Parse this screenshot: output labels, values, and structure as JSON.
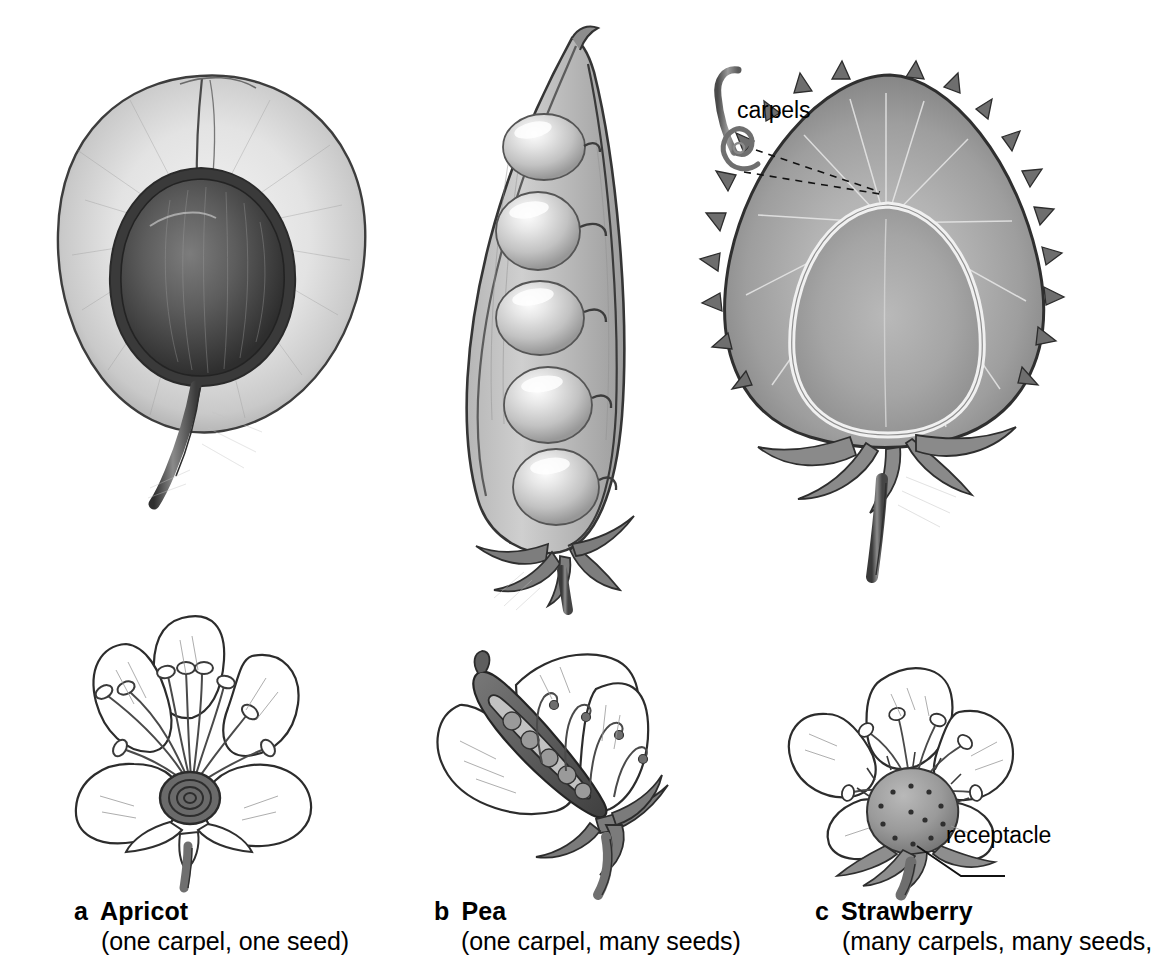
{
  "figure": {
    "background_color": "#ffffff",
    "ink_color": "#000000"
  },
  "callouts": {
    "carpels": "carpels",
    "receptacle": "receptacle"
  },
  "captions": [
    {
      "letter": "a",
      "title": "Apricot",
      "subtitle": "(one carpel, one seed)"
    },
    {
      "letter": "b",
      "title": "Pea",
      "subtitle": "(one carpel, many seeds)"
    },
    {
      "letter": "c",
      "title": "Strawberry",
      "subtitle": "(many carpels, many seeds,"
    }
  ],
  "panels": {
    "apricot_fruit": "apricot-longitudinal-section",
    "pea_fruit": "pea-pod-open-five-seeds",
    "strawberry_fruit": "strawberry-longitudinal-section",
    "apricot_flower": "apricot-flower-five-petals",
    "pea_flower": "pea-flower-cutaway-ovary",
    "strawberry_flower": "strawberry-flower-receptacle"
  }
}
